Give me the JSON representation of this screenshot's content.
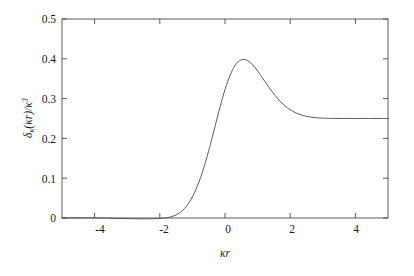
{
  "chart_data": {
    "type": "line",
    "title": "",
    "subtitle": "",
    "xlabel_plain": "kappa r",
    "ylabel_plain": "delta_kappa(kappa r) / kappa^3",
    "xlim": [
      -5,
      5
    ],
    "ylim": [
      0,
      0.5
    ],
    "xticks": [
      -4,
      -2,
      0,
      2,
      4
    ],
    "xtick_labels": [
      "-4",
      "-2",
      "0",
      "2",
      "4"
    ],
    "yticks": [
      0,
      0.1,
      0.2,
      0.3,
      0.4,
      0.5
    ],
    "ytick_labels": [
      "0",
      "0.1",
      "0.2",
      "0.3",
      "0.4",
      "0.5"
    ],
    "grid": false,
    "legend": null,
    "legend_position": "none",
    "line_color": "#4a4a4a",
    "line_width": 0.9,
    "series": [
      {
        "name": "delta_kappa",
        "x": [
          -5.0,
          -4.8,
          -4.6,
          -4.4,
          -4.2,
          -4.0,
          -3.8,
          -3.6,
          -3.4,
          -3.2,
          -3.0,
          -2.8,
          -2.6,
          -2.4,
          -2.2,
          -2.0,
          -1.9,
          -1.8,
          -1.7,
          -1.6,
          -1.5,
          -1.4,
          -1.3,
          -1.2,
          -1.1,
          -1.0,
          -0.9,
          -0.8,
          -0.7,
          -0.6,
          -0.5,
          -0.4,
          -0.3,
          -0.2,
          -0.1,
          0.0,
          0.1,
          0.2,
          0.3,
          0.4,
          0.5,
          0.6,
          0.7,
          0.8,
          0.9,
          1.0,
          1.1,
          1.2,
          1.3,
          1.4,
          1.5,
          1.6,
          1.7,
          1.8,
          1.9,
          2.0,
          2.2,
          2.4,
          2.6,
          2.8,
          3.0,
          3.2,
          3.4,
          3.6,
          3.8,
          4.0,
          4.2,
          4.4,
          4.6,
          4.8,
          5.0
        ],
        "y": [
          0.0,
          0.0002,
          0.0004,
          0.0005,
          0.0005,
          0.0003,
          0.0,
          -0.0004,
          -0.0008,
          -0.0012,
          -0.0015,
          -0.0018,
          -0.002,
          -0.002,
          -0.0018,
          -0.0012,
          -0.0006,
          0.0004,
          0.002,
          0.0044,
          0.0078,
          0.0126,
          0.0192,
          0.0278,
          0.039,
          0.053,
          0.07,
          0.0902,
          0.1136,
          0.14,
          0.169,
          0.2,
          0.232,
          0.264,
          0.2946,
          0.3226,
          0.347,
          0.367,
          0.3822,
          0.3924,
          0.3976,
          0.3984,
          0.3952,
          0.3888,
          0.38,
          0.3694,
          0.3578,
          0.3458,
          0.3338,
          0.3222,
          0.3114,
          0.3014,
          0.2924,
          0.2846,
          0.2778,
          0.272,
          0.2632,
          0.2574,
          0.2538,
          0.2518,
          0.2508,
          0.2504,
          0.2502,
          0.2501,
          0.25,
          0.25,
          0.25,
          0.25,
          0.25,
          0.25,
          0.25
        ]
      }
    ],
    "peak": {
      "x": 0.0,
      "y": 0.45
    }
  },
  "axis": {
    "ylabel_parts": {
      "delta": "δ",
      "sub_kappa": "κ",
      "open": "(",
      "kappa": "κ",
      "r": "r",
      "close": ")",
      "slash": "/",
      "kappa2": "κ",
      "exp3": "3"
    },
    "xlabel_parts": {
      "kappa": "κ",
      "r": "r"
    }
  },
  "figure": {
    "background_color": "#ffffff",
    "frame_color": "#4a4a4a",
    "text_color": "#1a1a1a"
  }
}
